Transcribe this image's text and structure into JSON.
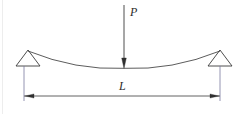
{
  "figure": {
    "type": "engineering-diagram",
    "background_color": "#ffffff",
    "line_color": "#3a3a3a",
    "text_color": "#2b2b2b"
  },
  "labels": {
    "load_label": "P",
    "span_label": "L"
  },
  "load": {
    "name": "point-load",
    "symbol": "P",
    "direction": "down",
    "arrow_top_y": 5,
    "arrow_tip_y": 68,
    "arrow_x": 124
  },
  "supports": {
    "left": {
      "name": "pin-support-left",
      "shape": "triangle",
      "apex_x": 28,
      "apex_y": 50,
      "base_y": 66,
      "base_left_x": 16,
      "base_right_x": 40
    },
    "right": {
      "name": "pin-support-right",
      "shape": "triangle",
      "apex_x": 220,
      "apex_y": 50,
      "base_y": 66,
      "base_left_x": 208,
      "base_right_x": 232
    }
  },
  "beam": {
    "name": "deflected-beam-curve",
    "left_end_x": 28,
    "left_end_y": 51,
    "right_end_x": 220,
    "right_end_y": 51,
    "midspan_x": 124,
    "midspan_y": 68,
    "description": "sagging curve between supports"
  },
  "dimension": {
    "name": "span-dimension",
    "symbol": "L",
    "line_y": 96,
    "left_x": 24,
    "right_x": 220,
    "extension_top_y": 66,
    "extension_bottom_y": 101,
    "arrowheads": "both-ends-inward"
  }
}
